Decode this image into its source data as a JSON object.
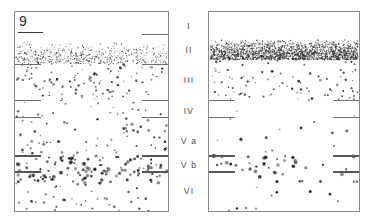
{
  "figure": {
    "panel_number": "9",
    "background_color": "#ffffff",
    "border_color": "#8a8a8a",
    "dot_color": "#2b2b2b",
    "tick_color": "#6e6e6e"
  },
  "layers": [
    {
      "id": "I",
      "label": "I",
      "center_pct": 8.0,
      "boundary_pct": 15.0
    },
    {
      "id": "II",
      "label": "II",
      "center_pct": 20.0,
      "boundary_pct": 26.0
    },
    {
      "id": "III",
      "label": "III",
      "center_pct": 35.0,
      "boundary_pct": 44.0
    },
    {
      "id": "IV",
      "label": "IV",
      "center_pct": 50.0,
      "boundary_pct": 53.0
    },
    {
      "id": "Va",
      "label": "V a",
      "center_pct": 65.0,
      "boundary_pct": 72.0
    },
    {
      "id": "Vb",
      "label": "V b",
      "center_pct": 77.0,
      "boundary_pct": 80.0
    },
    {
      "id": "VI",
      "label": "VI",
      "center_pct": 90.0,
      "boundary_pct": 100.0
    }
  ],
  "panels": [
    {
      "name": "left-panel",
      "number": "9",
      "show_number": true,
      "ticks_left": [
        26.0,
        44.0,
        53.0,
        72.0,
        80.0
      ],
      "ticks_right": [
        11.0,
        26.0,
        44.0,
        53.0,
        72.0,
        80.0
      ],
      "bands": [
        {
          "layer": "I",
          "top_pct": 0.0,
          "bottom_pct": 15.0,
          "density": "none",
          "count": 0,
          "size": 0.0
        },
        {
          "layer": "II",
          "top_pct": 15.0,
          "bottom_pct": 26.0,
          "density": "fine",
          "count": 620,
          "size": 0.5
        },
        {
          "layer": "III",
          "top_pct": 26.0,
          "bottom_pct": 44.0,
          "density": "sparse",
          "count": 110,
          "size": 0.9
        },
        {
          "layer": "IV",
          "top_pct": 44.0,
          "bottom_pct": 53.0,
          "density": "sparse",
          "count": 22,
          "size": 0.9
        },
        {
          "layer": "Va",
          "top_pct": 53.0,
          "bottom_pct": 72.0,
          "density": "moderate",
          "count": 60,
          "size": 1.1
        },
        {
          "layer": "Vb",
          "top_pct": 72.0,
          "bottom_pct": 86.0,
          "density": "dense",
          "count": 130,
          "size": 1.3
        },
        {
          "layer": "VI",
          "top_pct": 86.0,
          "bottom_pct": 100.0,
          "density": "sparse",
          "count": 38,
          "size": 1.0
        }
      ]
    },
    {
      "name": "right-panel",
      "number": "",
      "show_number": false,
      "ticks_left": [
        44.0,
        53.0,
        72.0,
        80.0
      ],
      "ticks_right": [
        44.0,
        53.0,
        72.0,
        80.0
      ],
      "bands": [
        {
          "layer": "I",
          "top_pct": 0.0,
          "bottom_pct": 14.0,
          "density": "none",
          "count": 0,
          "size": 0.0
        },
        {
          "layer": "II",
          "top_pct": 14.0,
          "bottom_pct": 24.0,
          "density": "verydense",
          "count": 2100,
          "size": 0.55
        },
        {
          "layer": "III",
          "top_pct": 24.0,
          "bottom_pct": 44.0,
          "density": "sparse",
          "count": 90,
          "size": 0.9
        },
        {
          "layer": "IV",
          "top_pct": 44.0,
          "bottom_pct": 53.0,
          "density": "none",
          "count": 3,
          "size": 0.8
        },
        {
          "layer": "Va",
          "top_pct": 53.0,
          "bottom_pct": 72.0,
          "density": "sparse",
          "count": 12,
          "size": 1.2
        },
        {
          "layer": "Vb",
          "top_pct": 72.0,
          "bottom_pct": 86.0,
          "density": "moderate",
          "count": 42,
          "size": 1.4
        },
        {
          "layer": "VI",
          "top_pct": 86.0,
          "bottom_pct": 100.0,
          "density": "sparse",
          "count": 10,
          "size": 1.1
        }
      ]
    }
  ]
}
